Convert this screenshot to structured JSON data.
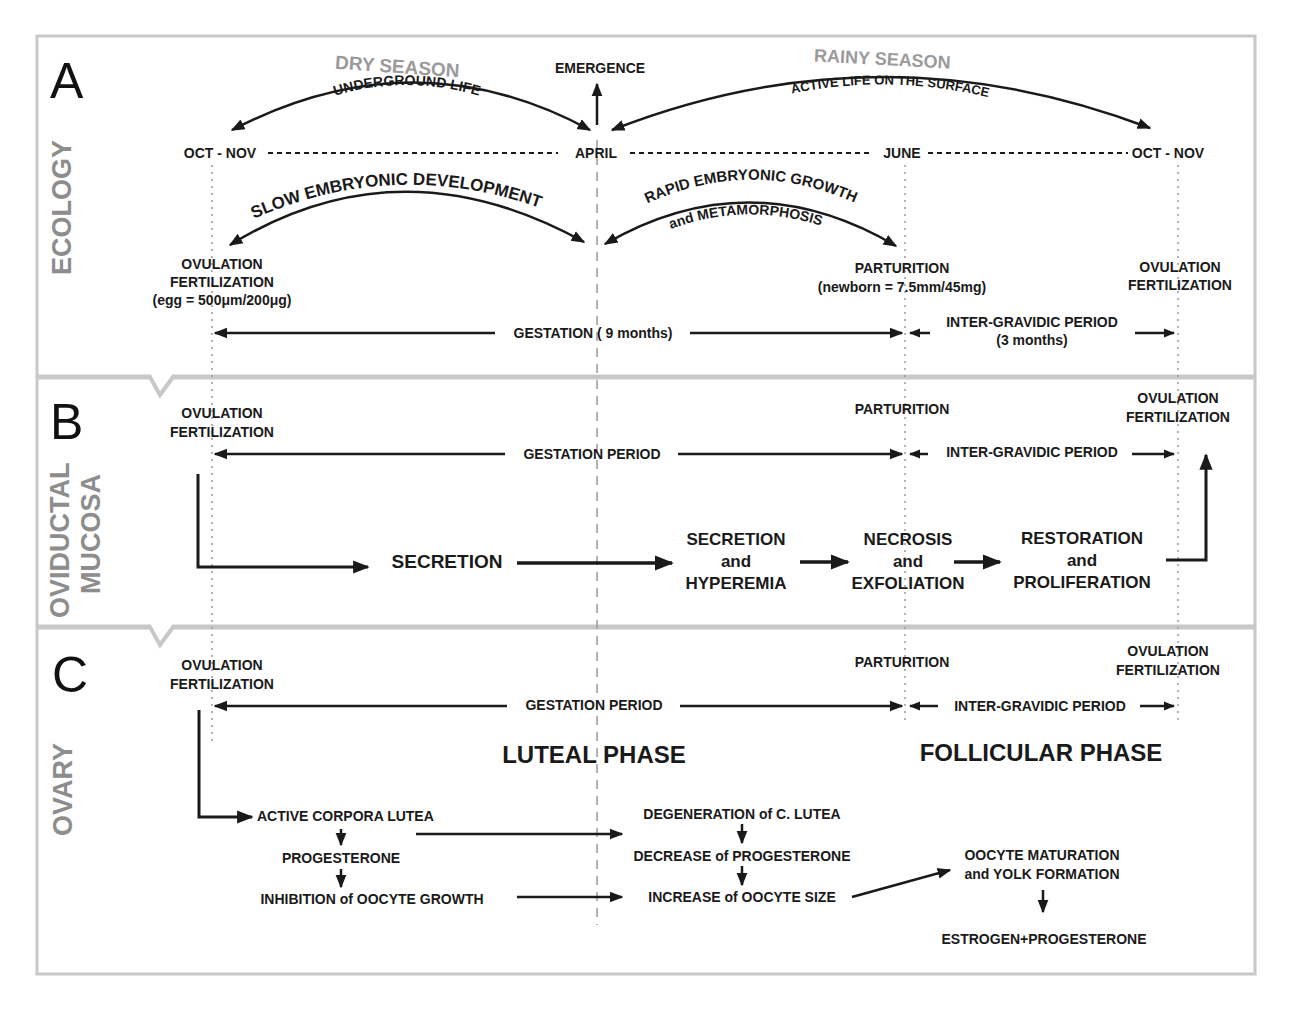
{
  "figure": {
    "colors": {
      "text": "#1a1a1a",
      "side_label": "#8d8d8d",
      "season_label": "#9a9a9a",
      "panel_border": "#c8c8c8",
      "background": "#ffffff"
    },
    "timeline_markers": [
      "OCT - NOV",
      "APRIL",
      "JUNE",
      "OCT - NOV"
    ],
    "panels": {
      "A": {
        "letter": "A",
        "side_label": "ECOLOGY",
        "dry_season": "DRY SEASON",
        "underground_life": "UNDERGROUND LIFE",
        "emergence": "EMERGENCE",
        "rainy_season": "RAINY SEASON",
        "active_life": "ACTIVE LIFE ON THE SURFACE",
        "month_left": "OCT - NOV",
        "month_april": "APRIL",
        "month_june": "JUNE",
        "month_right": "OCT - NOV",
        "slow_dev": "SLOW EMBRYONIC DEVELOPMENT",
        "rapid_growth": "RAPID EMBRYONIC GROWTH",
        "metamorphosis": "and METAMORPHOSIS",
        "ovulation_left_1": "OVULATION",
        "ovulation_left_2": "FERTILIZATION",
        "egg_size": "(egg = 500μm/200μg)",
        "parturition": "PARTURITION",
        "newborn_size": "(newborn = 7.5mm/45mg)",
        "ovulation_right_1": "OVULATION",
        "ovulation_right_2": "FERTILIZATION",
        "gestation": "GESTATION ( 9 months)",
        "intergravidic": "INTER-GRAVIDIC PERIOD",
        "intergravidic_duration": "(3 months)"
      },
      "B": {
        "letter": "B",
        "side_label_1": "OVIDUCTAL",
        "side_label_2": "MUCOSA",
        "ovulation_left_1": "OVULATION",
        "ovulation_left_2": "FERTILIZATION",
        "parturition": "PARTURITION",
        "ovulation_right_1": "OVULATION",
        "ovulation_right_2": "FERTILIZATION",
        "gestation_period": "GESTATION PERIOD",
        "intergravidic": "INTER-GRAVIDIC PERIOD",
        "stages": [
          {
            "l1": "SECRETION",
            "l2": "",
            "l3": ""
          },
          {
            "l1": "SECRETION",
            "l2": "and",
            "l3": "HYPEREMIA"
          },
          {
            "l1": "NECROSIS",
            "l2": "and",
            "l3": "EXFOLIATION"
          },
          {
            "l1": "RESTORATION",
            "l2": "and",
            "l3": "PROLIFERATION"
          }
        ]
      },
      "C": {
        "letter": "C",
        "side_label": "OVARY",
        "ovulation_left_1": "OVULATION",
        "ovulation_left_2": "FERTILIZATION",
        "parturition": "PARTURITION",
        "ovulation_right_1": "OVULATION",
        "ovulation_right_2": "FERTILIZATION",
        "gestation_period": "GESTATION PERIOD",
        "intergravidic": "INTER-GRAVIDIC PERIOD",
        "luteal_phase": "LUTEAL PHASE",
        "follicular_phase": "FOLLICULAR PHASE",
        "luteal_chain": [
          "ACTIVE CORPORA LUTEA",
          "PROGESTERONE",
          "INHIBITION of OOCYTE GROWTH"
        ],
        "transition_chain": [
          "DEGENERATION of C. LUTEA",
          "DECREASE of PROGESTERONE",
          "INCREASE of OOCYTE SIZE"
        ],
        "follicular_chain": [
          "OOCYTE MATURATION",
          "and YOLK FORMATION",
          "ESTROGEN+PROGESTERONE"
        ]
      }
    }
  }
}
